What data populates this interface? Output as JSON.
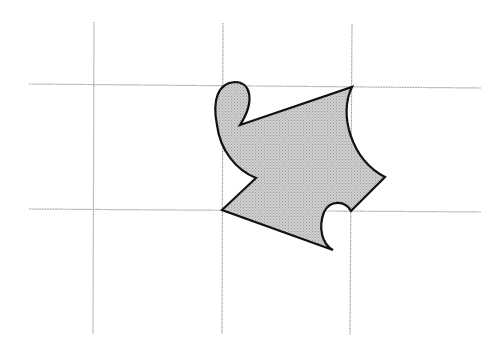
{
  "diagram": {
    "type": "tessellation-tile-on-grid",
    "colors": {
      "background": "#ffffff",
      "grid": "#9a9a9a",
      "shape_fill": "#c8c8c8",
      "shape_stroke": "#111111"
    },
    "grid": {
      "vertical_x": [
        94,
        222,
        352
      ],
      "vertical_y_range": [
        22,
        334
      ],
      "horizontal_y": [
        85,
        210
      ],
      "horizontal_x_range": [
        29,
        481
      ]
    },
    "shape": {
      "description": "Shaded tile with curved and straight edges spanning one grid square, with a loop at top-left, a notch on the left, a concave curve on the right and a bump near the bottom-right corner",
      "vertices": [
        {
          "name": "top-right-corner",
          "x": 352,
          "y": 87
        },
        {
          "name": "right-point",
          "x": 385,
          "y": 177
        },
        {
          "name": "bottom-right-corner",
          "x": 351,
          "y": 211
        },
        {
          "name": "bottom-tip",
          "x": 333,
          "y": 250
        },
        {
          "name": "bottom-left-corner",
          "x": 222,
          "y": 210
        },
        {
          "name": "left-notch",
          "x": 256,
          "y": 178
        },
        {
          "name": "inner-cusp",
          "x": 240,
          "y": 125
        }
      ]
    }
  }
}
